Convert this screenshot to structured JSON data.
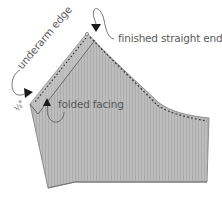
{
  "diagram": {
    "colors": {
      "fabric_fill": "#b9b9b9",
      "fabric_stripe": "#a9a9a9",
      "outline": "#6e6e6e",
      "stitch": "#333333",
      "label": "#5a5a5a",
      "arrow": "#1a1a1a"
    },
    "labels": {
      "underarm_edge": "underarm edge",
      "finished_straight_end": "finished straight end",
      "folded_facing": "folded facing",
      "half_inch": "½\""
    }
  }
}
